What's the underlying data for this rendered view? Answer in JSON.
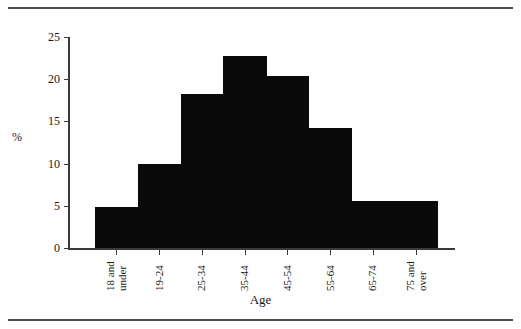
{
  "chart_data": {
    "type": "bar",
    "title": "",
    "subtitle": "",
    "xlabel": "Age",
    "ylabel": "%",
    "categories": [
      "18 and under",
      "19-24",
      "25-34",
      "35-44",
      "45-54",
      "55-64",
      "65-74",
      "75 and over"
    ],
    "category_lines": [
      [
        "18 and",
        "under"
      ],
      [
        "19-24"
      ],
      [
        "25-34"
      ],
      [
        "35-44"
      ],
      [
        "45-54"
      ],
      [
        "55-64"
      ],
      [
        "65-74"
      ],
      [
        "75 and",
        "over"
      ]
    ],
    "values": [
      4.9,
      10.0,
      18.2,
      22.7,
      20.4,
      14.2,
      5.6,
      5.6
    ],
    "ylim": [
      0,
      25
    ],
    "yticks": [
      0,
      5,
      10,
      15,
      20,
      25
    ],
    "ytick_labels": [
      "0",
      "5",
      "10",
      "15",
      "20",
      "25"
    ],
    "grid": false,
    "legend": false,
    "legend_position": "none",
    "bar_color": "#0a0a0a",
    "axis_color": "#3a3a3a",
    "bar_gap": 0,
    "note": "contiguous histogram-style bars"
  },
  "figure": {
    "top_rule": "horizontal-rule",
    "bottom_rule": "horizontal-rule",
    "background": "#ffffff"
  }
}
